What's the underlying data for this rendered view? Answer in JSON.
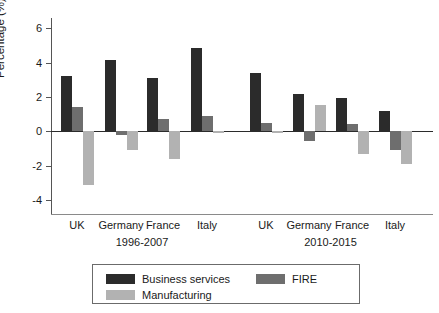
{
  "chart_data": {
    "type": "bar",
    "title": "",
    "subtitle": "",
    "xlabel": "",
    "ylabel": "Percentage (%)",
    "ylim": [
      -4.8,
      6.6
    ],
    "yticks": [
      6,
      4,
      2,
      0,
      -2,
      -4
    ],
    "ytick_labels": [
      "6",
      "4",
      "2",
      "0",
      "-2",
      "-4"
    ],
    "grid": false,
    "legend_position": "bottom",
    "zero_line": true,
    "orientation": "vertical",
    "categories": [
      "UK",
      "Germany",
      "France",
      "Italy",
      "UK",
      "Germany",
      "France",
      "Italy"
    ],
    "group_labels": [
      "1996-2007",
      "2010-2015"
    ],
    "groups": [
      {
        "label": "1996-2007",
        "categories": [
          "UK",
          "Germany",
          "France",
          "Italy"
        ]
      },
      {
        "label": "2010-2015",
        "categories": [
          "UK",
          "Germany",
          "France",
          "Italy"
        ]
      }
    ],
    "series": [
      {
        "name": "Business services",
        "color": "#2b2b2b",
        "values": [
          3.25,
          4.15,
          3.1,
          4.85,
          3.4,
          2.2,
          1.95,
          1.2
        ]
      },
      {
        "name": "FIRE",
        "color": "#6e6e6e",
        "values": [
          1.4,
          -0.2,
          0.7,
          0.9,
          0.5,
          -0.55,
          0.45,
          -1.1
        ]
      },
      {
        "name": "Manufacturing",
        "color": "#b2b2b2",
        "values": [
          -3.1,
          -1.1,
          -1.6,
          -0.05,
          -0.05,
          1.55,
          -1.3,
          -1.9
        ]
      }
    ],
    "legend": [
      {
        "label": "Business services",
        "color": "#2b2b2b"
      },
      {
        "label": "FIRE",
        "color": "#6e6e6e"
      },
      {
        "label": "Manufacturing",
        "color": "#b2b2b2"
      }
    ]
  }
}
